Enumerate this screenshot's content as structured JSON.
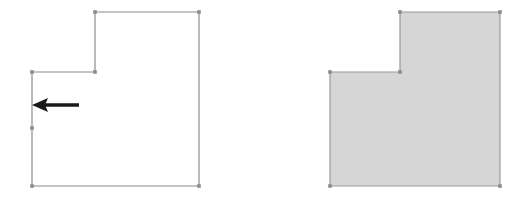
{
  "canvas": {
    "width": 518,
    "height": 201,
    "background_color": "#ffffff"
  },
  "colors": {
    "outline_stroke": "#8c8c8c",
    "vertex_marker": "#8c8c8c",
    "fill_gray": "#d6d6d6",
    "filled_stroke": "#999999",
    "arrow_color": "#1a1a1a"
  },
  "figures": [
    {
      "id": "wireframe-figure",
      "name": "L-shaped polygon outline",
      "render_mode": "outline",
      "stroke_width": 1.2,
      "vertices": [
        {
          "label": "A",
          "x": 95,
          "y": 12
        },
        {
          "label": "B",
          "x": 199,
          "y": 12
        },
        {
          "label": "C",
          "x": 199,
          "y": 186
        },
        {
          "label": "D",
          "x": 32,
          "y": 186
        },
        {
          "label": "E",
          "x": 32,
          "y": 72
        },
        {
          "label": "F",
          "x": 95,
          "y": 72
        }
      ],
      "path": "M 95 12 L 199 12 L 199 186 L 32 186 L 32 72 L 95 72 Z",
      "vertex_markers": [
        {
          "x": 95,
          "y": 12
        },
        {
          "x": 199,
          "y": 12
        },
        {
          "x": 199,
          "y": 186
        },
        {
          "x": 32,
          "y": 186
        },
        {
          "x": 32,
          "y": 72
        },
        {
          "x": 95,
          "y": 72
        },
        {
          "x": 32,
          "y": 128
        }
      ]
    },
    {
      "id": "solid-figure",
      "name": "L-shaped polygon filled",
      "render_mode": "filled",
      "stroke_width": 1.2,
      "vertices": [
        {
          "label": "A",
          "x": 400,
          "y": 12
        },
        {
          "label": "B",
          "x": 500,
          "y": 12
        },
        {
          "label": "C",
          "x": 500,
          "y": 186
        },
        {
          "label": "D",
          "x": 330,
          "y": 186
        },
        {
          "label": "E",
          "x": 330,
          "y": 72
        },
        {
          "label": "F",
          "x": 400,
          "y": 72
        }
      ],
      "path": "M 400 12 L 500 12 L 500 186 L 330 186 L 330 72 L 400 72 Z",
      "vertex_markers": [
        {
          "x": 400,
          "y": 12
        },
        {
          "x": 500,
          "y": 12
        },
        {
          "x": 500,
          "y": 186
        },
        {
          "x": 330,
          "y": 186
        },
        {
          "x": 330,
          "y": 72
        },
        {
          "x": 400,
          "y": 72
        }
      ]
    }
  ],
  "annotations": {
    "direction_arrow": {
      "name": "left-pointing direction arrow",
      "direction": "left",
      "tail_x": 79,
      "head_x": 32,
      "y": 105,
      "shaft_thickness": 3.4,
      "head_length": 16,
      "head_half_height": 7
    },
    "edge_segment": {
      "name": "highlighted left edge",
      "x": 32,
      "y_start": 72,
      "y_end": 128
    }
  }
}
